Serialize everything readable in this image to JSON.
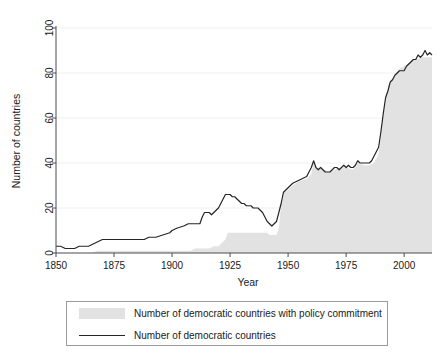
{
  "chart_data": {
    "type": "area",
    "title": "",
    "xlabel": "Year",
    "ylabel": "Number of countries",
    "xlim": [
      1850,
      2012
    ],
    "ylim": [
      0,
      100
    ],
    "xticks": [
      1850,
      1875,
      1900,
      1925,
      1950,
      1975,
      2000
    ],
    "yticks": [
      0,
      20,
      40,
      60,
      80,
      100
    ],
    "grid": "horizontal",
    "legend_position": "bottom",
    "series": [
      {
        "name": "Number of democratic countries with policy commitment",
        "render": "area",
        "color": "#e2e2e2",
        "x": [
          1850,
          1855,
          1860,
          1865,
          1868,
          1870,
          1875,
          1880,
          1885,
          1890,
          1895,
          1900,
          1905,
          1908,
          1910,
          1912,
          1914,
          1916,
          1918,
          1920,
          1921,
          1922,
          1923,
          1924,
          1925,
          1926,
          1928,
          1930,
          1932,
          1934,
          1936,
          1938,
          1940,
          1941,
          1942,
          1943,
          1944,
          1945,
          1946,
          1947,
          1948,
          1950,
          1952,
          1955,
          1958,
          1960,
          1961,
          1962,
          1965,
          1968,
          1970,
          1973,
          1975,
          1978,
          1980,
          1983,
          1985,
          1987,
          1989,
          1990,
          1991,
          1992,
          1994,
          1996,
          1998,
          2000,
          2003,
          2005,
          2008,
          2010,
          2012
        ],
        "values": [
          0,
          0,
          0,
          0,
          1,
          1,
          1,
          1,
          1,
          1,
          1,
          1,
          1,
          1,
          2,
          2,
          2,
          2,
          3,
          3,
          4,
          5,
          6,
          9,
          9,
          9,
          9,
          9,
          9,
          9,
          9,
          9,
          9,
          9,
          8,
          8,
          8,
          8,
          11,
          22,
          27,
          28,
          30,
          32,
          33,
          35,
          41,
          38,
          37,
          36,
          37,
          38,
          38,
          37,
          40,
          39,
          39,
          40,
          44,
          52,
          62,
          70,
          76,
          79,
          82,
          83,
          85,
          86,
          87,
          87,
          87
        ]
      },
      {
        "name": "Number of democratic countries",
        "render": "line",
        "color": "#262626",
        "x": [
          1850,
          1852,
          1854,
          1856,
          1858,
          1860,
          1862,
          1864,
          1866,
          1868,
          1870,
          1872,
          1875,
          1878,
          1880,
          1884,
          1888,
          1890,
          1893,
          1896,
          1899,
          1900,
          1902,
          1905,
          1907,
          1908,
          1910,
          1911,
          1912,
          1913,
          1914,
          1916,
          1917,
          1918,
          1919,
          1920,
          1921,
          1922,
          1923,
          1924,
          1925,
          1926,
          1927,
          1928,
          1929,
          1930,
          1931,
          1932,
          1933,
          1934,
          1935,
          1936,
          1937,
          1938,
          1939,
          1940,
          1941,
          1942,
          1943,
          1944,
          1945,
          1946,
          1947,
          1948,
          1949,
          1950,
          1951,
          1952,
          1954,
          1956,
          1958,
          1959,
          1960,
          1961,
          1962,
          1963,
          1964,
          1965,
          1966,
          1967,
          1968,
          1969,
          1970,
          1971,
          1972,
          1973,
          1974,
          1975,
          1976,
          1977,
          1978,
          1979,
          1980,
          1981,
          1982,
          1983,
          1984,
          1985,
          1986,
          1987,
          1988,
          1989,
          1990,
          1991,
          1992,
          1993,
          1994,
          1995,
          1996,
          1997,
          1998,
          1999,
          2000,
          2001,
          2002,
          2003,
          2004,
          2005,
          2006,
          2007,
          2008,
          2009,
          2010,
          2011,
          2012
        ],
        "values": [
          3,
          3,
          2,
          2,
          2,
          3,
          3,
          3,
          4,
          5,
          6,
          6,
          6,
          6,
          6,
          6,
          6,
          7,
          7,
          8,
          9,
          10,
          11,
          12,
          13,
          13,
          13,
          13,
          13,
          16,
          18,
          18,
          17,
          18,
          19,
          20,
          22,
          24,
          26,
          26,
          26,
          25,
          25,
          24,
          23,
          22,
          22,
          21,
          21,
          21,
          20,
          20,
          20,
          19,
          18,
          16,
          14,
          13,
          12,
          13,
          14,
          18,
          22,
          27,
          28,
          29,
          30,
          31,
          32,
          33,
          34,
          36,
          38,
          41,
          38,
          37,
          38,
          37,
          36,
          36,
          36,
          37,
          38,
          38,
          37,
          38,
          39,
          38,
          39,
          38,
          38,
          39,
          41,
          40,
          40,
          40,
          40,
          40,
          41,
          43,
          45,
          47,
          54,
          62,
          69,
          72,
          76,
          77,
          79,
          80,
          81,
          81,
          81,
          83,
          84,
          85,
          86,
          86,
          88,
          87,
          88,
          90,
          88,
          89,
          88
        ]
      }
    ]
  },
  "axes": {
    "xlabel": "Year",
    "ylabel": "Number of countries",
    "xtick_labels": [
      "1850",
      "1875",
      "1900",
      "1925",
      "1950",
      "1975",
      "2000"
    ],
    "ytick_labels": [
      "0",
      "20",
      "40",
      "60",
      "80",
      "100"
    ]
  },
  "legend": {
    "items": [
      {
        "label": "Number of democratic countries with policy commitment",
        "marker": "area-swatch"
      },
      {
        "label": "Number of democratic countries",
        "marker": "line-swatch"
      }
    ]
  },
  "colors": {
    "area_fill": "#e2e2e2",
    "line": "#262626",
    "grid": "#efefef",
    "axis": "#4d4d4d",
    "legend_border": "#9a9a9a"
  }
}
